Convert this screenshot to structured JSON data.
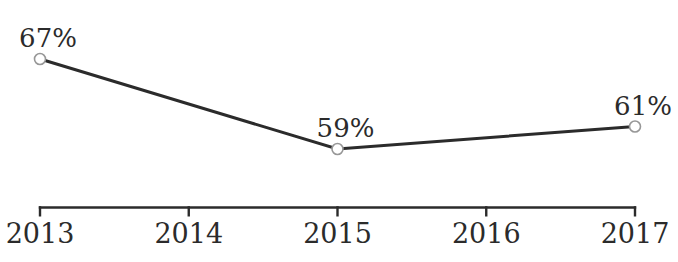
{
  "chart_data": {
    "type": "line",
    "title": "",
    "xlabel": "",
    "ylabel": "",
    "grid": false,
    "legend_position": "none",
    "x_ticks": [
      "2013",
      "2014",
      "2015",
      "2016",
      "2017"
    ],
    "points": [
      {
        "x": "2013",
        "value": 67,
        "label": "67%"
      },
      {
        "x": "2015",
        "value": 59,
        "label": "59%"
      },
      {
        "x": "2017",
        "value": 61,
        "label": "61%"
      }
    ],
    "value_suffix": "%",
    "colors": {
      "line": "#2b2b2b",
      "axis": "#2b2b2b",
      "text": "#2b2b2b",
      "marker_stroke": "#979797",
      "marker_fill": "#ffffff",
      "background": "#ffffff"
    }
  }
}
